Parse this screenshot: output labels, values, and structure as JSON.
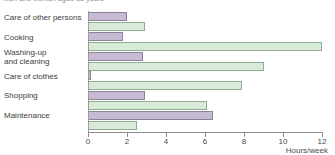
{
  "chart_data": {
    "type": "bar",
    "orientation": "horizontal",
    "grouped": true,
    "title": "Men and women aged 16 years",
    "xlabel": "Hours/week",
    "ylabel": "",
    "xlim": [
      0,
      12
    ],
    "xticks": [
      0,
      2,
      4,
      6,
      8,
      10,
      12
    ],
    "xtick_labels": [
      "0",
      "2",
      "4",
      "6",
      "8",
      "10",
      "12"
    ],
    "grid": false,
    "legend": "none",
    "categories": [
      "Care of other persons",
      "Cooking",
      "Washing-up\nand cleaning",
      "Care of clothes",
      "Shopping",
      "Maintenance"
    ],
    "series": [
      {
        "name": "Series A",
        "color": "#c5bcd4",
        "edge_color": "#8d8398",
        "values": [
          2.0,
          1.8,
          2.8,
          0.15,
          2.9,
          6.4
        ]
      },
      {
        "name": "Series B",
        "color": "#d8ead8",
        "edge_color": "#8fae91",
        "values": [
          2.9,
          12.0,
          9.0,
          7.9,
          6.1,
          2.5
        ]
      }
    ]
  },
  "axis": {
    "x_title": "Hours/week"
  },
  "colors": {
    "series_a_fill": "#c5bcd4",
    "series_a_edge": "#8d8398",
    "series_b_fill": "#d8ead8",
    "series_b_edge": "#8fae91",
    "axis_line": "#8f8f8f",
    "text": "#3c3c3c"
  }
}
